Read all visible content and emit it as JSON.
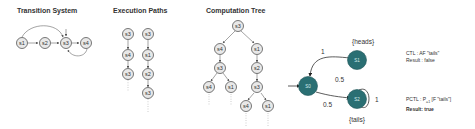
{
  "sections": {
    "transition_system": {
      "title": "Transition System"
    },
    "execution_paths": {
      "title": "Execution Paths"
    },
    "computation_tree": {
      "title": "Computation Tree"
    }
  },
  "transition_system": {
    "nodes": [
      "s1",
      "s2",
      "s3",
      "s4"
    ]
  },
  "execution_paths": {
    "path1": [
      "s3",
      "s4",
      "s3"
    ],
    "path2": [
      "s3",
      "s1",
      "s2",
      "s3"
    ]
  },
  "computation_tree": {
    "root": "s3",
    "level1": [
      "s4",
      "s1"
    ],
    "level2": [
      "s3",
      "s2"
    ],
    "level3": [
      "s4",
      "s1",
      "s3"
    ],
    "level4": [
      "s4",
      "s1"
    ]
  },
  "mdp": {
    "s0": "S0",
    "s1": "S1",
    "s2": "S2",
    "label_heads": "{heads}",
    "label_tails": "{tails}",
    "p_s1_s0": "1",
    "p_s0_s1": "0.5",
    "p_s0_s2": "0.5",
    "p_s2_s2": "1"
  },
  "results": {
    "ctl_formula": "CTL : AF \"tails\"",
    "ctl_result": "Result : false",
    "pctl_formula_prefix": "PCTL : P",
    "pctl_sub": "=1",
    "pctl_formula_suffix": " [F \"tails\"]",
    "pctl_result": "Result: true"
  }
}
